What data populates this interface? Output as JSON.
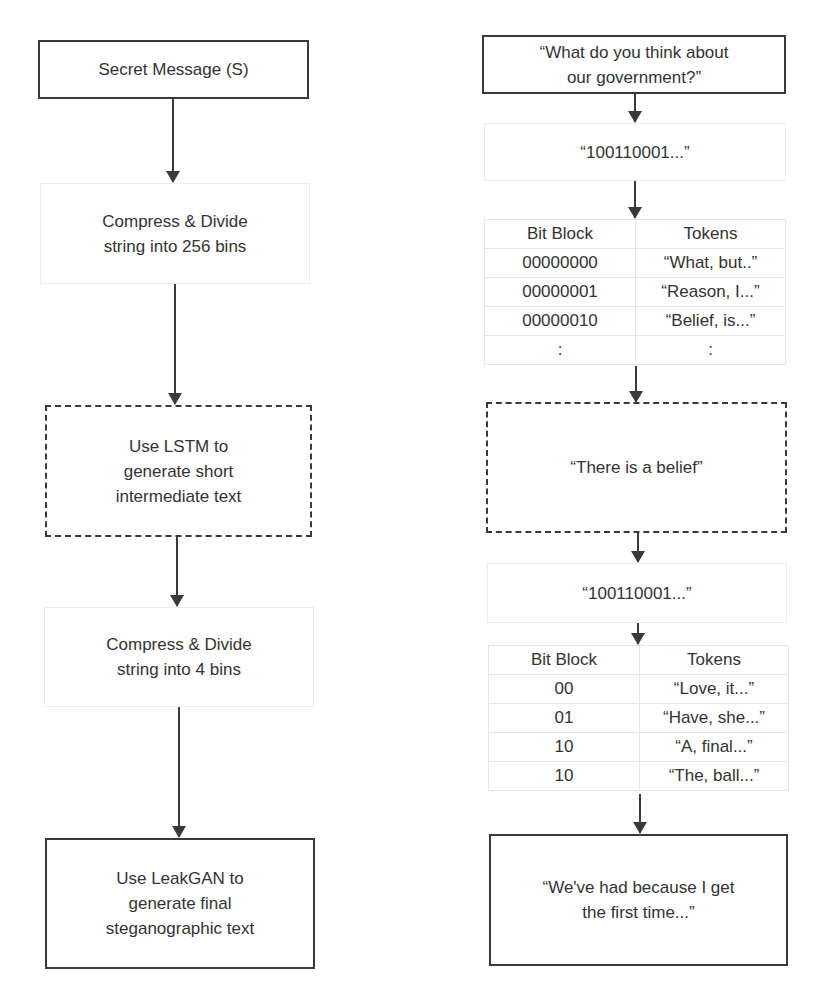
{
  "left_flow": {
    "secret_message": "Secret Message (S)",
    "compress_256": [
      "Compress & Divide",
      "string into 256 bins"
    ],
    "lstm": [
      "Use LSTM to",
      "generate short",
      "intermediate text"
    ],
    "compress_4": [
      "Compress & Divide",
      "string into 4 bins"
    ],
    "leakgan": [
      "Use LeakGAN to",
      "generate final",
      "steganographic text"
    ]
  },
  "right_flow": {
    "question": [
      "“What do you think about",
      "our government?”"
    ],
    "bits_1": "“100110001...”",
    "table_1": {
      "headers": [
        "Bit Block",
        "Tokens"
      ],
      "rows": [
        [
          "00000000",
          "“What, but..”"
        ],
        [
          "00000001",
          "“Reason, I...”"
        ],
        [
          "00000010",
          "“Belief, is...”"
        ],
        [
          ":",
          ":"
        ]
      ]
    },
    "intermediate_text": "“There is a belief”",
    "bits_2": "“100110001...”",
    "table_2": {
      "headers": [
        "Bit Block",
        "Tokens"
      ],
      "rows": [
        [
          "00",
          "“Love, it...”"
        ],
        [
          "01",
          "“Have, she...”"
        ],
        [
          "10",
          "“A, final...”"
        ],
        [
          "10",
          "“The, ball...”"
        ]
      ]
    },
    "final_text": [
      "“We've had because I get",
      "the first time...”"
    ]
  },
  "caption": "(caption text cut off at bottom edge)"
}
